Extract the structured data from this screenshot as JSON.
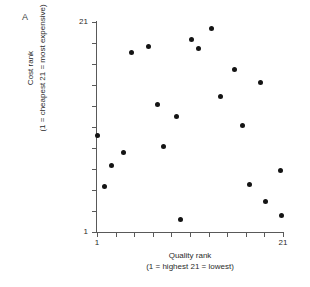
{
  "panel": {
    "letter": "A"
  },
  "chart_data": {
    "type": "scatter",
    "title": "",
    "panel_label": "A",
    "xlabel": "Quality rank",
    "xlabel_sub": "(1 = highest   21 = lowest)",
    "ylabel": "Cost rank",
    "ylabel_sub": "(1 = cheapest   21 = most expensive)",
    "xlim": [
      1,
      21
    ],
    "ylim": [
      1,
      21
    ],
    "xticks": [
      1,
      3,
      5,
      7,
      9,
      11,
      13,
      15,
      17,
      19,
      21
    ],
    "yticks": [
      1,
      3,
      5,
      7,
      9,
      11,
      13,
      15,
      17,
      19,
      21
    ],
    "xtick_labels": {
      "first": "1",
      "last": "21"
    },
    "ytick_labels": {
      "first": "1",
      "last": "21"
    },
    "grid": false,
    "legend": false,
    "marker_color": "#141414",
    "axis_color": "#595959",
    "n_points": 21,
    "points": [
      {
        "x": 1.1,
        "y": 10.2
      },
      {
        "x": 1.8,
        "y": 5.3
      },
      {
        "x": 2.6,
        "y": 7.3
      },
      {
        "x": 3.9,
        "y": 8.6
      },
      {
        "x": 4.7,
        "y": 18.1
      },
      {
        "x": 6.5,
        "y": 18.7
      },
      {
        "x": 7.5,
        "y": 13.1
      },
      {
        "x": 8.1,
        "y": 9.1
      },
      {
        "x": 9.5,
        "y": 12.0
      },
      {
        "x": 10.0,
        "y": 2.2
      },
      {
        "x": 11.2,
        "y": 19.3
      },
      {
        "x": 11.9,
        "y": 18.5
      },
      {
        "x": 13.3,
        "y": 20.4
      },
      {
        "x": 14.3,
        "y": 13.9
      },
      {
        "x": 15.8,
        "y": 16.5
      },
      {
        "x": 16.6,
        "y": 11.1
      },
      {
        "x": 17.4,
        "y": 5.5
      },
      {
        "x": 18.6,
        "y": 15.2
      },
      {
        "x": 19.1,
        "y": 3.9
      },
      {
        "x": 20.7,
        "y": 6.9
      },
      {
        "x": 20.8,
        "y": 2.6
      }
    ]
  }
}
